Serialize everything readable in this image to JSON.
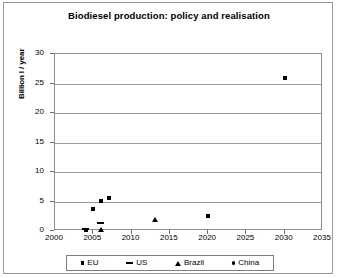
{
  "chart_data": {
    "type": "scatter",
    "title": "Biodiesel production: policy and realisation",
    "xlabel": "",
    "ylabel": "Billion l / year",
    "xlim": [
      2000,
      2035
    ],
    "ylim": [
      0,
      30
    ],
    "xticks": [
      2000,
      2005,
      2010,
      2015,
      2020,
      2025,
      2030,
      2035
    ],
    "yticks": [
      0,
      5,
      10,
      15,
      20,
      25,
      30
    ],
    "grid": "horizontal",
    "legend_position": "bottom",
    "series": [
      {
        "name": "EU",
        "marker": "square",
        "color": "#000000",
        "points": [
          {
            "x": 2004,
            "y": 0.2
          },
          {
            "x": 2005,
            "y": 3.7
          },
          {
            "x": 2006,
            "y": 5.1
          },
          {
            "x": 2007,
            "y": 5.6
          },
          {
            "x": 2020,
            "y": 2.5
          }
        ]
      },
      {
        "name": "US",
        "marker": "dash",
        "color": "#000000",
        "points": [
          {
            "x": 2004,
            "y": 0.3
          },
          {
            "x": 2006,
            "y": 1.3
          }
        ]
      },
      {
        "name": "Brazil",
        "marker": "triangle",
        "color": "#000000",
        "points": [
          {
            "x": 2006,
            "y": 0.3
          },
          {
            "x": 2013,
            "y": 2.0
          }
        ]
      },
      {
        "name": "China",
        "marker": "dot",
        "color": "#000000",
        "points": [
          {
            "x": 2030,
            "y": 26.0
          }
        ]
      }
    ]
  },
  "legend": {
    "items": [
      {
        "label": "EU",
        "marker": "square"
      },
      {
        "label": "US",
        "marker": "dash"
      },
      {
        "label": "Brazil",
        "marker": "triangle"
      },
      {
        "label": "China",
        "marker": "dot"
      }
    ]
  }
}
